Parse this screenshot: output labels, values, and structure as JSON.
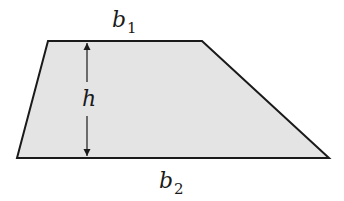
{
  "figure": {
    "shape": "trapezoid",
    "fill_color": "#e4e4e4",
    "stroke_color": "#1a1a1a",
    "vertices": {
      "top_left": [
        48,
        41
      ],
      "top_right": [
        202,
        41
      ],
      "bottom_right": [
        329,
        158
      ],
      "bottom_left": [
        17,
        158
      ]
    },
    "height_arrow": {
      "x": 87,
      "y_top": 41,
      "y_bottom": 158
    }
  },
  "labels": {
    "top_base": {
      "main": "b",
      "sub": "1"
    },
    "bottom_base": {
      "main": "b",
      "sub": "2"
    },
    "height": "h"
  }
}
